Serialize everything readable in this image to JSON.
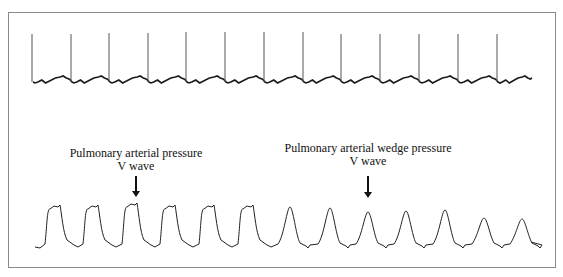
{
  "figure": {
    "ecg_trace": {
      "label": "ECG",
      "spike_x": [
        32,
        71,
        109,
        148,
        186,
        225,
        264,
        303,
        341,
        380,
        419,
        458,
        497
      ],
      "baseline_y": 82,
      "peak_y": 32,
      "start_x": 34,
      "end_x": 532,
      "color": "#1a1a1a"
    },
    "pressure_trace": {
      "label": "Pressure",
      "pa_plateaus_x": [
        50,
        88,
        127,
        165,
        204,
        243
      ],
      "pa_plateau_y": 206,
      "pcwp_peaks_x": [
        290,
        330,
        368,
        406,
        445,
        484,
        522
      ],
      "pcwp_peak_y": [
        207,
        208,
        212,
        211,
        210,
        218,
        219
      ],
      "baseline_y": 246,
      "start_x": 35,
      "end_x": 531,
      "color": "#1a1a1a"
    },
    "annotations": [
      {
        "line1": "Pulmonary arterial pressure",
        "line2": "V wave",
        "x": 136,
        "arrow_top": 176,
        "arrow_bottom": 198
      },
      {
        "line1": "Pulmonary arterial wedge pressure",
        "line2": "V wave",
        "x": 368,
        "arrow_top": 176,
        "arrow_bottom": 199
      }
    ]
  }
}
